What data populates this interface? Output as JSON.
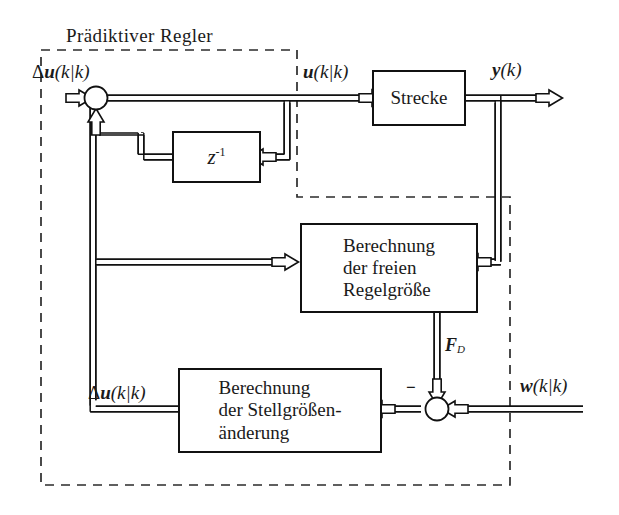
{
  "diagram": {
    "title": "Prädiktiver Regler",
    "controller_boundary_label": "Prädiktiver Regler",
    "blocks": {
      "plant": {
        "label": "Strecke"
      },
      "delay": {
        "label_base": "z",
        "label_exponent": "-1"
      },
      "free_response": {
        "line1": "Berechnung",
        "line2": "der freien",
        "line3": "Regelgröße"
      },
      "control_increment": {
        "line1": "Berechnung",
        "line2": "der Stellgrößen-",
        "line3": "änderung"
      }
    },
    "signals": {
      "delta_u_top": {
        "delta": "Δ",
        "var": "u",
        "arg": "(k|k)"
      },
      "u_plant_in": {
        "var": "u",
        "arg": "(k|k)"
      },
      "y_out": {
        "var": "y",
        "arg": "(k)"
      },
      "w_ref": {
        "var": "w",
        "arg": "(k|k)"
      },
      "delta_u_bottom": {
        "delta": "Δ",
        "var": "u",
        "arg": "(k|k)"
      },
      "f_d": {
        "var": "F",
        "sub": "D"
      },
      "minus_sign": "−"
    },
    "colors": {
      "line": "#111111",
      "background": "#ffffff",
      "text": "#1a1a1a",
      "dashed_boundary": "#2b2b2b"
    }
  }
}
